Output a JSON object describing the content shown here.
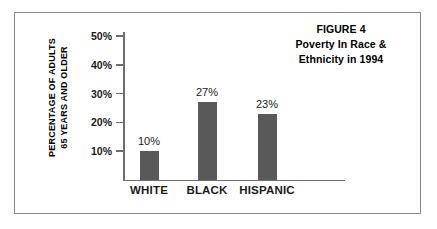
{
  "figure": {
    "title_lines": [
      "FIGURE 4",
      "Poverty In Race &",
      "Ethnicity in 1994"
    ],
    "y_axis_title_lines": [
      "PERCENTAGE OF ADULTS",
      "65 YEARS AND OLDER"
    ],
    "border_color": "#8a8a8a",
    "background_color": "#ffffff"
  },
  "chart_data": {
    "type": "bar",
    "title": "FIGURE 4 Poverty In Race & Ethnicity in 1994",
    "xlabel": "",
    "ylabel": "PERCENTAGE OF ADULTS 65 YEARS AND OLDER",
    "categories": [
      "WHITE",
      "BLACK",
      "HISPANIC"
    ],
    "values": [
      10,
      27,
      23
    ],
    "value_labels": [
      "10%",
      "27%",
      "23%"
    ],
    "ylim": [
      0,
      50
    ],
    "ytick_values": [
      10,
      20,
      30,
      40,
      50
    ],
    "ytick_labels": [
      "10%",
      "20%",
      "30%",
      "40%",
      "50%"
    ],
    "grid": false,
    "legend": null,
    "bar_color": "#595959",
    "axis_color": "#6e6e6e"
  }
}
